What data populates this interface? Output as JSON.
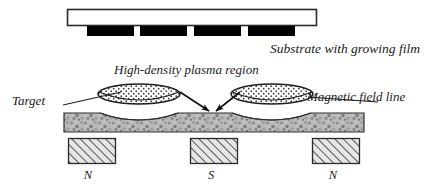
{
  "figure": {
    "background_color": "#ffffff",
    "width": 437,
    "height": 185
  },
  "labels": {
    "substrate": "Substrate with growing film",
    "plasma": "High-density plasma region",
    "target": "Target",
    "field_line": "Magnetic field line",
    "pole_left": "N",
    "pole_center": "S",
    "pole_right": "N"
  },
  "colors": {
    "outline": "#1a1a1a",
    "film": "#000000",
    "substrate_fill": "#ffffff",
    "target_fill": "#b4b4b4",
    "magnet_fill": "#d9d9d9",
    "plasma_fill": "#ffffff",
    "text": "#1a1a1a"
  },
  "components": {
    "substrate": {
      "name": "substrate-bar",
      "x": 67,
      "y": 9,
      "width": 250,
      "height": 17
    },
    "film_segments": [
      {
        "name": "film-segment-1",
        "x": 87,
        "y": 26,
        "width": 47,
        "height": 10
      },
      {
        "name": "film-segment-2",
        "x": 140,
        "y": 26,
        "width": 47,
        "height": 10
      },
      {
        "name": "film-segment-3",
        "x": 194,
        "y": 26,
        "width": 47,
        "height": 10
      },
      {
        "name": "film-segment-4",
        "x": 248,
        "y": 26,
        "width": 47,
        "height": 10
      }
    ],
    "plasma_regions": [
      {
        "name": "plasma-region-left",
        "cx": 139,
        "cy": 94,
        "rx": 41,
        "ry": 10
      },
      {
        "name": "plasma-region-right",
        "cx": 272,
        "cy": 94,
        "rx": 41,
        "ry": 10
      }
    ],
    "target": {
      "name": "target-bar",
      "x": 64,
      "y": 113,
      "width": 300,
      "height": 19
    },
    "magnets": [
      {
        "name": "magnet-north-left",
        "x": 68,
        "y": 138,
        "width": 48,
        "height": 26,
        "pole": "N"
      },
      {
        "name": "magnet-south-center",
        "x": 190,
        "y": 138,
        "width": 48,
        "height": 26,
        "pole": "S"
      },
      {
        "name": "magnet-north-right",
        "x": 312,
        "y": 138,
        "width": 48,
        "height": 26,
        "pole": "N"
      }
    ],
    "arrows": [
      {
        "name": "sputter-arrow-left",
        "x1": 182,
        "y1": 93,
        "x2": 210,
        "y2": 112
      },
      {
        "name": "sputter-arrow-right",
        "x1": 238,
        "y1": 93,
        "x2": 214,
        "y2": 112
      }
    ],
    "leaders": [
      {
        "name": "target-leader-line",
        "x1": 66,
        "y1": 104,
        "x2": 118,
        "y2": 92
      },
      {
        "name": "field-line-leader-line",
        "x1": 375,
        "y1": 101,
        "x2": 309,
        "y2": 96
      }
    ]
  }
}
